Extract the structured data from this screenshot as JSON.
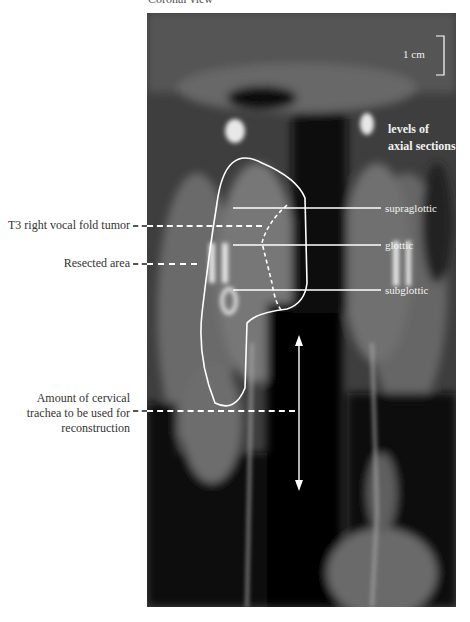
{
  "caption_top": "Coronal view",
  "scale_bar": {
    "label": "1 cm"
  },
  "levels_title": "levels of\naxial sections",
  "levels": [
    {
      "label": "supraglottic"
    },
    {
      "label": "glottic"
    },
    {
      "label": "subglottic"
    }
  ],
  "annotations": [
    {
      "label": "T3 right vocal fold tumor"
    },
    {
      "label": "Resected area"
    },
    {
      "label": "Amount of cervical\ntrachea to be used for\nreconstruction"
    }
  ],
  "colors": {
    "overlay": "#ffffff",
    "label_text": "#333333",
    "background": "#ffffff"
  }
}
